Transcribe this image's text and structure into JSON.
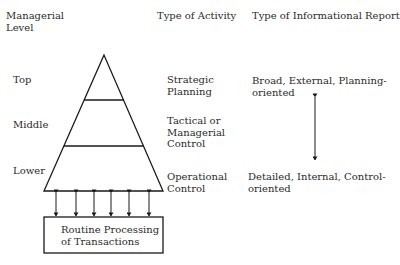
{
  "headers": {
    "level": "Managerial\nLevel",
    "activity": "Type of Activity",
    "report": "Type of Informational Report"
  },
  "levels": [
    {
      "name": "Top",
      "activity": "Strategic\nPlanning",
      "report": "Broad, External, Planning-\noriented"
    },
    {
      "name": "Middle",
      "activity": "Tactical or\nManagerial\nControl",
      "report": ""
    },
    {
      "name": "Lower",
      "activity": "Operational\nControl",
      "report": "Detailed, Internal, Control-\noriented"
    }
  ],
  "base_box": {
    "label": "Routine Processing\nof Transactions"
  },
  "arrows": {
    "count": 6,
    "type": "bidirectional"
  },
  "continuum_arrow": {
    "type": "bidirectional-vertical"
  },
  "colors": {
    "line": "#1a1a1a",
    "text": "#2a2a2a",
    "background": "#ffffff"
  }
}
